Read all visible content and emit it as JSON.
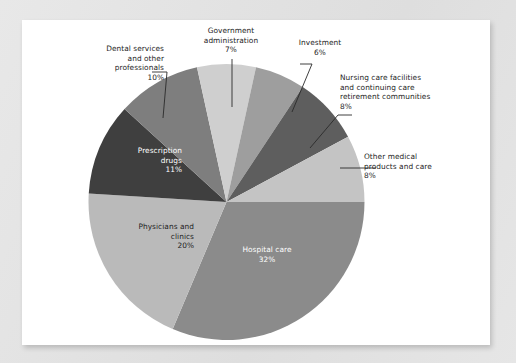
{
  "chart_data": {
    "type": "pie",
    "title": "",
    "subtitle": "",
    "xlabel": "",
    "ylabel": "",
    "legend_position": "none",
    "grid": false,
    "units": "percent",
    "total": 102,
    "start_angle_deg": 0,
    "direction": "clockwise",
    "categories": [
      "Hospital care",
      "Physicians and clinics",
      "Prescription drugs",
      "Dental services and other professionals",
      "Government administration",
      "Investment",
      "Nursing care facilities and continuing care retirement communities",
      "Other medical products and care"
    ],
    "values": [
      32,
      20,
      11,
      10,
      7,
      6,
      8,
      8
    ],
    "slices": [
      {
        "name": "hospital-care",
        "label": "Hospital care",
        "value": 32,
        "value_text": "32%",
        "color": "#8b8b8b",
        "label_placement": "inside",
        "label_color": "#ffffff",
        "label_align": "center",
        "label_lines": [
          "Hospital care",
          "32%"
        ]
      },
      {
        "name": "physicians-and-clinics",
        "label": "Physicians and clinics",
        "value": 20,
        "value_text": "20%",
        "color": "#bababa",
        "label_placement": "inside",
        "label_color": "#1d1d1d",
        "label_align": "right",
        "label_lines": [
          "Physicians and",
          "clinics",
          "20%"
        ]
      },
      {
        "name": "prescription-drugs",
        "label": "Prescription drugs",
        "value": 11,
        "value_text": "11%",
        "color": "#3f3f3f",
        "label_placement": "inside",
        "label_color": "#ffffff",
        "label_align": "right",
        "label_lines": [
          "Prescription",
          "drugs",
          "11%"
        ]
      },
      {
        "name": "dental-services",
        "label": "Dental services and other professionals",
        "value": 10,
        "value_text": "10%",
        "color": "#7e7e7e",
        "label_placement": "callout",
        "label_color": "#1d1d1d",
        "label_align": "right",
        "label_lines": [
          "Dental services",
          "and other",
          "professionals",
          "10%"
        ]
      },
      {
        "name": "government-administration",
        "label": "Government administration",
        "value": 7,
        "value_text": "7%",
        "color": "#cfcfcf",
        "label_placement": "callout",
        "label_color": "#1d1d1d",
        "label_align": "center",
        "label_lines": [
          "Government",
          "administration",
          "7%"
        ]
      },
      {
        "name": "investment",
        "label": "Investment",
        "value": 6,
        "value_text": "6%",
        "color": "#9e9e9e",
        "label_placement": "callout",
        "label_color": "#1d1d1d",
        "label_align": "center",
        "label_lines": [
          "Investment",
          "6%"
        ]
      },
      {
        "name": "nursing-care-facilities",
        "label": "Nursing care facilities and continuing care retirement communities",
        "value": 8,
        "value_text": "8%",
        "color": "#5e5e5e",
        "label_placement": "callout",
        "label_color": "#1d1d1d",
        "label_align": "left",
        "label_lines": [
          "Nursing care facilities",
          "and continuing care",
          "retirement communities",
          "8%"
        ]
      },
      {
        "name": "other-medical-products",
        "label": "Other medical products and care",
        "value": 8,
        "value_text": "8%",
        "color": "#c4c4c4",
        "label_placement": "callout",
        "label_color": "#1d1d1d",
        "label_align": "left",
        "label_lines": [
          "Other medical",
          "products and care",
          "8%"
        ]
      }
    ]
  },
  "labels": {
    "government": "Government\nadministration\n7%",
    "investment": "Investment\n6%",
    "nursing": "Nursing care facilities\nand continuing care\nretirement communities\n8%",
    "other_medical": "Other medical\nproducts and care\n8%",
    "dental": "Dental services\nand other\nprofessionals\n10%",
    "prescription": "Prescription\ndrugs\n11%",
    "physicians": "Physicians and\nclinics\n20%",
    "hospital": "Hospital care\n32%"
  },
  "colors": {
    "page_background": "#e3e3e3",
    "card_background": "#ffffff",
    "text": "#1d1d1d",
    "text_on_dark": "#ffffff",
    "leader_line": "#2a2a2a"
  }
}
